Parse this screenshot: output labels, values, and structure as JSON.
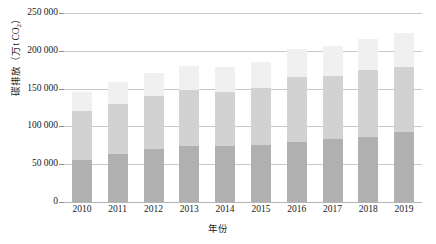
{
  "chart_data": {
    "type": "bar",
    "stacked": true,
    "title": "",
    "xlabel": "年份",
    "ylabel": "碳排放（万t CO2）",
    "ylabel_parts": {
      "pre": "碳排放（万t CO",
      "sub": "2",
      "post": "）"
    },
    "categories": [
      "2010",
      "2011",
      "2012",
      "2013",
      "2014",
      "2015",
      "2016",
      "2017",
      "2018",
      "2019"
    ],
    "ylim": [
      0,
      250000
    ],
    "ytick_labels": [
      "0",
      "50 000",
      "100 000",
      "150 000",
      "200 000",
      "250 000"
    ],
    "ytick_values": [
      0,
      50000,
      100000,
      150000,
      200000,
      250000
    ],
    "grid": true,
    "legend": "none",
    "series": [
      {
        "name": "下层",
        "color": "#b0b0b0",
        "values": [
          55000,
          64000,
          70000,
          74000,
          74000,
          75000,
          79000,
          83000,
          86000,
          93000
        ]
      },
      {
        "name": "中层",
        "color": "#d2d2d2",
        "values": [
          65000,
          66000,
          70000,
          74000,
          72000,
          76000,
          86000,
          84000,
          88000,
          85000
        ]
      },
      {
        "name": "上层",
        "color": "#f0f0f0",
        "values": [
          26000,
          29000,
          31000,
          32000,
          32000,
          34000,
          37000,
          40000,
          42000,
          46000
        ]
      }
    ],
    "totals": [
      146000,
      159000,
      171000,
      180000,
      178000,
      185000,
      202000,
      207000,
      216000,
      224000
    ]
  }
}
